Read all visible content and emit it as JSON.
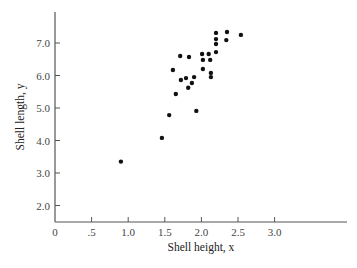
{
  "chart_data": {
    "type": "scatter",
    "title": "",
    "xlabel": "Shell height, x",
    "ylabel": "Shell length, y",
    "xlim": [
      0,
      3.95
    ],
    "ylim": [
      1.5,
      7.95
    ],
    "grid": false,
    "legend": null,
    "x_ticks": [
      0,
      0.5,
      1.0,
      1.5,
      2.0,
      2.5,
      3.0
    ],
    "x_tick_labels": [
      "0",
      ".5",
      "1.0",
      "1.5",
      "2.0",
      "2.5",
      "3.0"
    ],
    "y_ticks": [
      2.0,
      3.0,
      4.0,
      5.0,
      6.0,
      7.0
    ],
    "y_tick_labels": [
      "2.0",
      "3.0",
      "4.0",
      "5.0",
      "6.0",
      "7.0"
    ],
    "points": [
      {
        "x": 0.9,
        "y": 3.35
      },
      {
        "x": 1.46,
        "y": 4.08
      },
      {
        "x": 1.56,
        "y": 4.78
      },
      {
        "x": 1.65,
        "y": 5.43
      },
      {
        "x": 1.93,
        "y": 4.91
      },
      {
        "x": 1.82,
        "y": 5.62
      },
      {
        "x": 1.61,
        "y": 6.17
      },
      {
        "x": 1.71,
        "y": 6.6
      },
      {
        "x": 1.83,
        "y": 6.57
      },
      {
        "x": 1.72,
        "y": 5.86
      },
      {
        "x": 1.79,
        "y": 5.92
      },
      {
        "x": 1.9,
        "y": 5.95
      },
      {
        "x": 1.87,
        "y": 5.77
      },
      {
        "x": 2.01,
        "y": 6.66
      },
      {
        "x": 2.1,
        "y": 6.66
      },
      {
        "x": 2.02,
        "y": 6.48
      },
      {
        "x": 2.12,
        "y": 6.48
      },
      {
        "x": 2.02,
        "y": 6.2
      },
      {
        "x": 2.13,
        "y": 6.08
      },
      {
        "x": 2.13,
        "y": 5.95
      },
      {
        "x": 2.2,
        "y": 6.72
      },
      {
        "x": 2.2,
        "y": 6.97
      },
      {
        "x": 2.2,
        "y": 7.12
      },
      {
        "x": 2.2,
        "y": 7.31
      },
      {
        "x": 2.34,
        "y": 7.09
      },
      {
        "x": 2.35,
        "y": 7.34
      },
      {
        "x": 2.54,
        "y": 7.25
      }
    ],
    "colors": {
      "point": "#111111",
      "axis": "#555555",
      "text": "#444444"
    }
  }
}
